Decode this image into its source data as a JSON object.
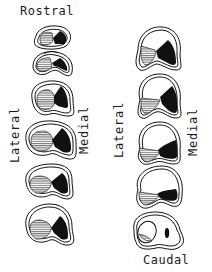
{
  "labels": {
    "top": "Rostral",
    "bottom": "Caudal",
    "left_column_lateral": "Lateral",
    "left_column_medial": "Medial",
    "right_column_lateral": "Lateral",
    "right_column_medial": "Medial"
  },
  "legend": {
    "hatched_region": "lateral region (horizontal hatching)",
    "black_region": "medial region (solid black)"
  },
  "colors": {
    "ink": "#111111",
    "background": "#ffffff",
    "hatch": "#555555"
  },
  "sections": {
    "left_column_count": 6,
    "right_column_count": 5,
    "order": "rostral to caudal, left column top to bottom then right column top to bottom"
  }
}
